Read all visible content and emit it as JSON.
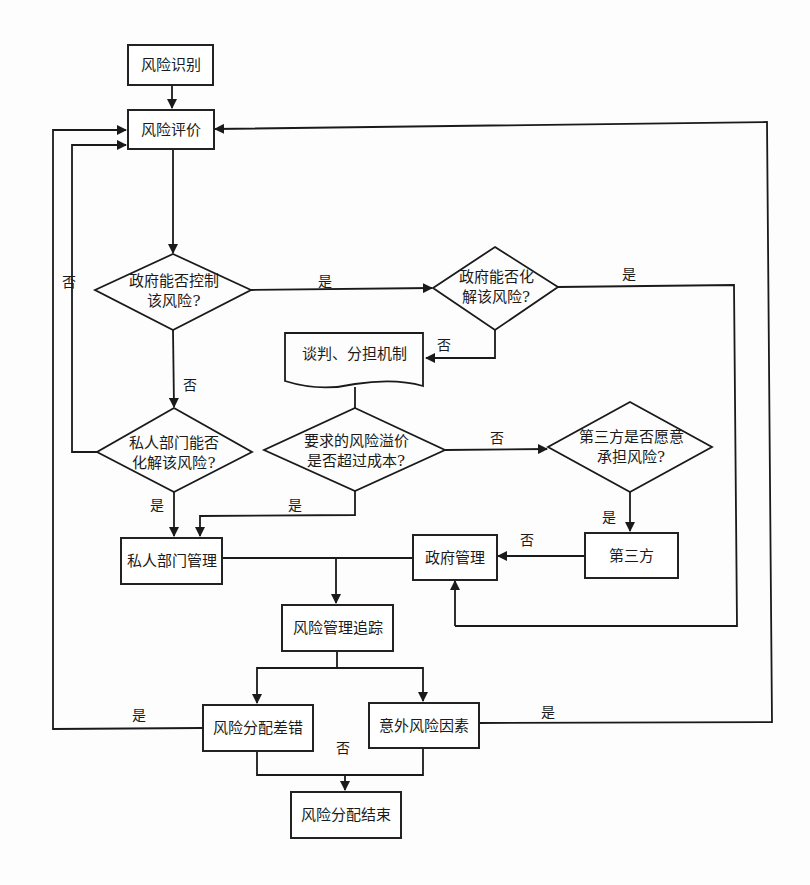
{
  "diagram": {
    "nodes": {
      "identify": "风险识别",
      "evaluate": "风险评价",
      "gov_control": "政府能否控制\n该风险?",
      "gov_resolve": "政府能否化\n解该风险?",
      "negotiate": "谈判、分担机制",
      "premium": "要求的风险溢价\n是否超过成本?",
      "private_resolve": "私人部门能否\n化解该风险?",
      "third_party_willing": "第三方是否愿意\n承担风险?",
      "private_mgmt": "私人部门管理",
      "gov_mgmt": "政府管理",
      "third_party": "第三方",
      "tracking": "风险管理追踪",
      "allocation_error": "风险分配差错",
      "unexpected": "意外风险因素",
      "end": "风险分配结束"
    },
    "edge_labels": {
      "gov_control_yes": "是",
      "gov_control_no": "否",
      "gov_resolve_yes": "是",
      "gov_resolve_no": "否",
      "private_resolve_no": "否",
      "private_resolve_yes": "是",
      "premium_yes": "是",
      "premium_no": "否",
      "third_party_yes": "是",
      "third_party_no": "否",
      "allocation_error_yes": "是",
      "unexpected_yes": "是",
      "final_no": "否"
    }
  }
}
